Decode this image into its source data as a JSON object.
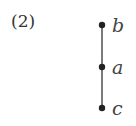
{
  "figure_label": "(2)",
  "diagram": {
    "type": "hasse",
    "nodes": [
      {
        "id": "b",
        "label": "b",
        "x": 102,
        "y": 25
      },
      {
        "id": "a",
        "label": "a",
        "x": 102,
        "y": 67
      },
      {
        "id": "c",
        "label": "c",
        "x": 102,
        "y": 108
      }
    ],
    "edges": [
      [
        "b",
        "a"
      ],
      [
        "a",
        "c"
      ]
    ],
    "colors": {
      "node": "#222222",
      "edge": "#333333"
    }
  }
}
